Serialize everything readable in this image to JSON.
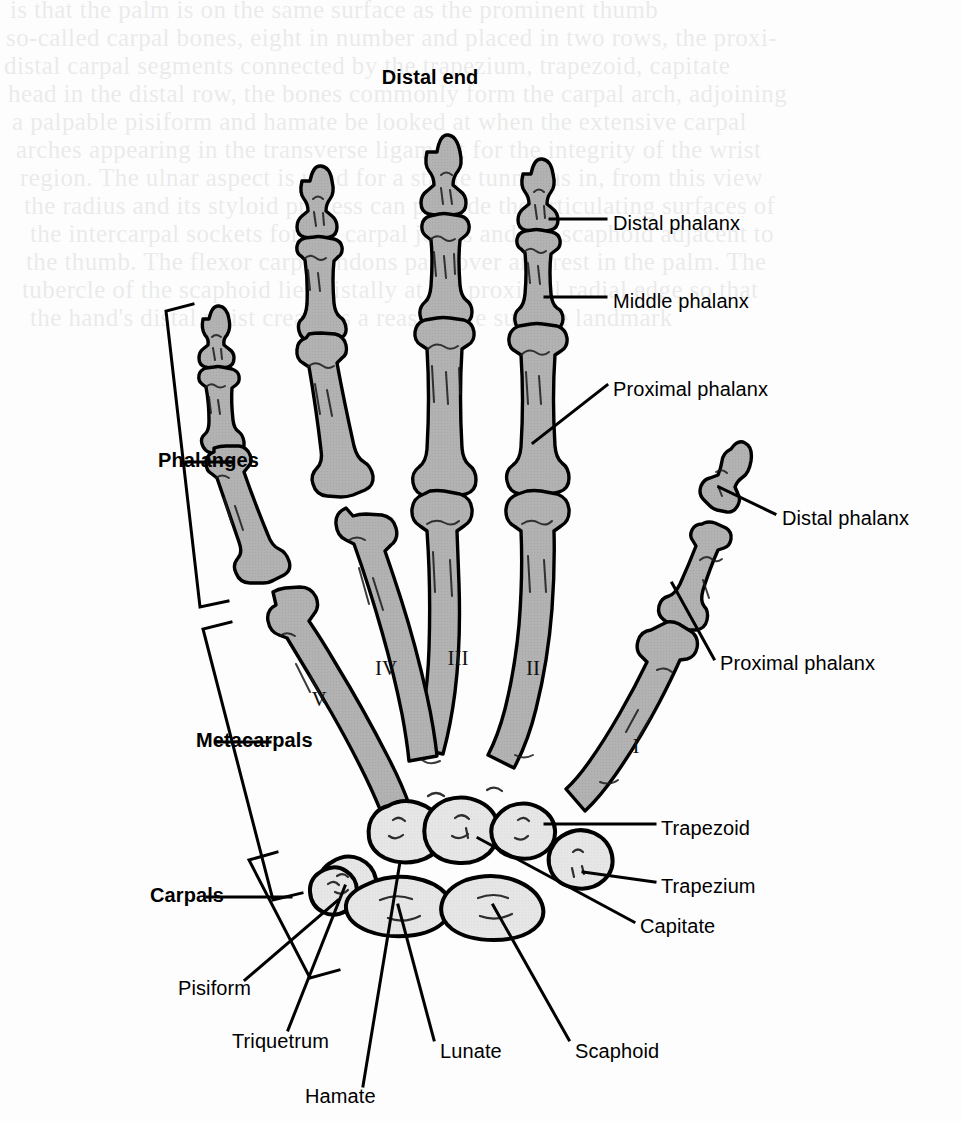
{
  "figure": {
    "title": "Distal end",
    "bone_fill": "#b2b2b2",
    "carpal_fill": "#e6e6e6",
    "outline": "#000000",
    "background": "#ffffff"
  },
  "bracket_labels": [
    {
      "id": "phalanges",
      "text": "Phalanges",
      "x": 158,
      "y": 462
    },
    {
      "id": "metacarpals",
      "text": "Metacarpals",
      "x": 196,
      "y": 742
    },
    {
      "id": "carpals",
      "text": "Carpals",
      "x": 150,
      "y": 897
    }
  ],
  "bone_labels": [
    {
      "id": "distal-phalanx-digit2",
      "text": "Distal phalanx",
      "x": 613,
      "y": 225,
      "align": "left"
    },
    {
      "id": "middle-phalanx-digit2",
      "text": "Middle phalanx",
      "x": 613,
      "y": 303,
      "align": "left"
    },
    {
      "id": "proximal-phalanx-digit2",
      "text": "Proximal phalanx",
      "x": 613,
      "y": 391,
      "align": "left"
    },
    {
      "id": "distal-phalanx-thumb",
      "text": "Distal phalanx",
      "x": 782,
      "y": 520,
      "align": "left"
    },
    {
      "id": "proximal-phalanx-thumb",
      "text": "Proximal phalanx",
      "x": 720,
      "y": 665,
      "align": "left"
    },
    {
      "id": "trapezoid",
      "text": "Trapezoid",
      "x": 661,
      "y": 830,
      "align": "left"
    },
    {
      "id": "trapezium",
      "text": "Trapezium",
      "x": 661,
      "y": 888,
      "align": "left"
    },
    {
      "id": "capitate",
      "text": "Capitate",
      "x": 640,
      "y": 928,
      "align": "left"
    },
    {
      "id": "pisiform",
      "text": "Pisiform",
      "x": 178,
      "y": 990,
      "align": "left"
    },
    {
      "id": "triquetrum",
      "text": "Triquetrum",
      "x": 232,
      "y": 1043,
      "align": "left"
    },
    {
      "id": "lunate",
      "text": "Lunate",
      "x": 440,
      "y": 1053,
      "align": "left"
    },
    {
      "id": "scaphoid",
      "text": "Scaphoid",
      "x": 575,
      "y": 1053,
      "align": "left"
    },
    {
      "id": "hamate",
      "text": "Hamate",
      "x": 305,
      "y": 1098,
      "align": "left"
    }
  ],
  "metacarpal_numerals": [
    {
      "id": "metacarpal-1",
      "text": "I",
      "x": 636,
      "y": 746
    },
    {
      "id": "metacarpal-2",
      "text": "II",
      "x": 533,
      "y": 668
    },
    {
      "id": "metacarpal-3",
      "text": "III",
      "x": 458,
      "y": 658
    },
    {
      "id": "metacarpal-4",
      "text": "IV",
      "x": 386,
      "y": 668
    },
    {
      "id": "metacarpal-5",
      "text": "V",
      "x": 319,
      "y": 699
    }
  ],
  "ghost_text": [
    {
      "x": 10,
      "y": -4,
      "t": "is that the palm is on the same surface as the prominent thumb"
    },
    {
      "x": 6,
      "y": 24,
      "t": "so-called carpal bones, eight in number and placed in two rows, the proxi-"
    },
    {
      "x": 4,
      "y": 52,
      "t": "distal carpal segments connected by the trapezium, trapezoid, capitate"
    },
    {
      "x": 8,
      "y": 80,
      "t": "head in the distal row, the bones commonly form the carpal arch, adjoining"
    },
    {
      "x": 12,
      "y": 108,
      "t": "a palpable pisiform and hamate be looked at when the extensive carpal"
    },
    {
      "x": 16,
      "y": 136,
      "t": "arches appearing in the transverse ligament for the integrity of the wrist"
    },
    {
      "x": 20,
      "y": 164,
      "t": "region. The ulnar aspect is used for a stable tunnel as in, from this view"
    },
    {
      "x": 24,
      "y": 192,
      "t": "the radius and its styloid process can provide the articulating surfaces of"
    },
    {
      "x": 30,
      "y": 220,
      "t": "the intercarpal sockets for the carpal joints and the scaphoid adjacent to"
    },
    {
      "x": 26,
      "y": 248,
      "t": "the thumb. The flexor carpi tendons pass over and rest in the palm. The"
    },
    {
      "x": 22,
      "y": 276,
      "t": "tubercle of the scaphoid lies distally at the proximal radial edge so that"
    },
    {
      "x": 30,
      "y": 304,
      "t": "the hand's distal wrist crease is a reasonable surface landmark"
    }
  ]
}
